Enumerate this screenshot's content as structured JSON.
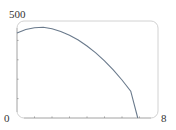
{
  "chart_data": {
    "type": "line",
    "title": "",
    "xlabel": "",
    "ylabel": "",
    "xlim": [
      0,
      8
    ],
    "ylim": [
      0,
      500
    ],
    "x_tick_labels": [
      "0",
      "8"
    ],
    "y_tick_labels": [
      "500"
    ],
    "x_minor_ticks": [
      1,
      2,
      3,
      4,
      5,
      6,
      7
    ],
    "y_minor_ticks": [
      100,
      200,
      300,
      400
    ],
    "grid": false,
    "legend": null,
    "series": [
      {
        "name": "curve",
        "x": [
          0,
          0.5,
          1,
          1.5,
          2,
          2.5,
          3,
          3.5,
          4,
          4.5,
          5,
          5.5,
          6,
          6.5,
          6.9
        ],
        "y": [
          438,
          456,
          465,
          468,
          460,
          446,
          427,
          402,
          371,
          336,
          295,
          248,
          196,
          138,
          0
        ]
      }
    ],
    "colors": {
      "curve": "#6a7a8c",
      "frame": "#c8c8c8",
      "axis": "#b0b0b0"
    }
  },
  "labels": {
    "y_max": "500",
    "origin": "0",
    "x_max": "8"
  }
}
